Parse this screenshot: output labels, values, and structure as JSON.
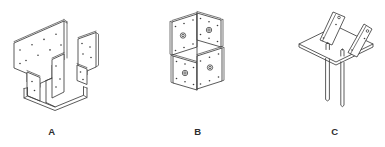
{
  "stage": {
    "background": "#ffffff",
    "line_color": "#3d3d3d",
    "label_color": "#2e2e2e"
  },
  "figures": [
    {
      "label": "A"
    },
    {
      "label": "B"
    },
    {
      "label": "C"
    }
  ]
}
